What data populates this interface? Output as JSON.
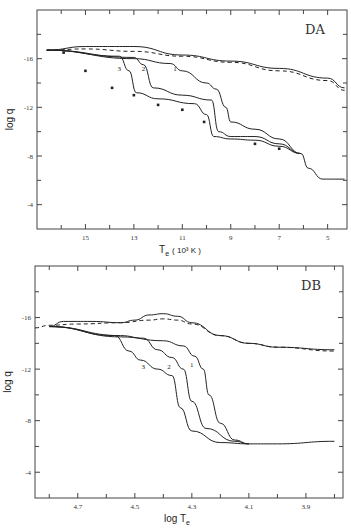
{
  "chart_data": [
    {
      "type": "line",
      "panel": "DA",
      "title": "DA",
      "xlabel": "Te (10^3 K)",
      "ylabel": "log q",
      "xlim": [
        17.0,
        4.2
      ],
      "ylim": [
        -2,
        -20
      ],
      "xticks": [
        "15",
        "13",
        "11",
        "9",
        "7",
        "5"
      ],
      "yticks": [
        "-16",
        "-12",
        "-8",
        "-4"
      ],
      "series": [
        {
          "name": "upper envelope (solid)",
          "x": [
            16.6,
            15,
            13,
            11,
            9,
            7,
            5,
            4.3
          ],
          "y": [
            -16.7,
            -17.0,
            -17.0,
            -16.3,
            -15.8,
            -15.2,
            -14.4,
            -13.6
          ]
        },
        {
          "name": "upper envelope (dashed)",
          "x": [
            16.6,
            15,
            13,
            11,
            9,
            7,
            5,
            4.3
          ],
          "y": [
            -16.7,
            -16.8,
            -16.6,
            -16.2,
            -15.7,
            -15.0,
            -14.2,
            -13.4
          ]
        },
        {
          "name": "1",
          "x": [
            16.6,
            13,
            11.5,
            11,
            10,
            9.6,
            9.2,
            9,
            8,
            7,
            6.1,
            5.8,
            5.2,
            4.3
          ],
          "y": [
            -16.7,
            -16.0,
            -15.6,
            -15.0,
            -14.0,
            -13.5,
            -12.0,
            -10.8,
            -10.2,
            -9.4,
            -8.2,
            -7.0,
            -6.1,
            -6.1
          ]
        },
        {
          "name": "2",
          "x": [
            16.6,
            13,
            12.6,
            12.2,
            11,
            9.8,
            9.5,
            9,
            8,
            7,
            6.1
          ],
          "y": [
            -16.7,
            -16.1,
            -15.5,
            -13.6,
            -13.0,
            -12.6,
            -10.0,
            -9.6,
            -9.6,
            -9.0,
            -8.2
          ]
        },
        {
          "name": "3",
          "x": [
            16.6,
            13.6,
            13.2,
            12.9,
            12,
            10.5,
            10,
            9.7,
            9,
            8,
            7,
            6.1
          ],
          "y": [
            -16.7,
            -16.2,
            -15.0,
            -13.2,
            -12.7,
            -12.3,
            -11.4,
            -9.6,
            -9.4,
            -9.3,
            -8.8,
            -8.2
          ]
        }
      ],
      "points": {
        "x": [
          15.9,
          15.0,
          13.9,
          13.0,
          12.0,
          11.0,
          10.1,
          8.0,
          7.0
        ],
        "y": [
          -16.5,
          -15.0,
          -13.6,
          -13.0,
          -12.2,
          -11.8,
          -10.8,
          -9.0,
          -8.6
        ]
      },
      "annotations": [
        "1",
        "2",
        "3",
        "DA"
      ]
    },
    {
      "type": "line",
      "panel": "DB",
      "title": "DB",
      "xlabel": "log Te",
      "ylabel": "log q",
      "xlim": [
        4.85,
        3.77
      ],
      "ylim": [
        -2,
        -20
      ],
      "xticks": [
        "4.7",
        "4.5",
        "4.3",
        "4.1",
        "3.9"
      ],
      "yticks": [
        "-16",
        "-12",
        "-8",
        "-4"
      ],
      "series": [
        {
          "name": "upper envelope (solid)",
          "x": [
            4.8,
            4.75,
            4.65,
            4.55,
            4.5,
            4.45,
            4.4,
            4.35,
            4.3,
            4.2,
            4.1,
            4.0,
            3.8
          ],
          "y": [
            -15.3,
            -15.7,
            -15.7,
            -15.6,
            -15.8,
            -16.2,
            -16.3,
            -16.1,
            -15.6,
            -14.6,
            -14.0,
            -13.7,
            -13.5
          ]
        },
        {
          "name": "upper envelope (dashed)",
          "x": [
            4.85,
            4.8,
            4.7,
            4.55,
            4.45,
            4.4,
            4.35,
            4.3,
            4.2,
            4.1,
            4.0,
            3.8
          ],
          "y": [
            -15.2,
            -15.4,
            -15.5,
            -15.6,
            -15.8,
            -15.9,
            -15.8,
            -15.5,
            -14.6,
            -14.0,
            -13.7,
            -13.4
          ]
        },
        {
          "name": "1",
          "x": [
            4.8,
            4.55,
            4.4,
            4.33,
            4.29,
            4.26,
            4.24,
            4.2,
            4.15,
            4.1,
            4.0,
            3.8
          ],
          "y": [
            -15.3,
            -14.5,
            -14.2,
            -13.8,
            -13.0,
            -12.0,
            -10.0,
            -7.8,
            -6.5,
            -6.2,
            -6.2,
            -6.4
          ]
        },
        {
          "name": "2",
          "x": [
            4.8,
            4.55,
            4.47,
            4.42,
            4.37,
            4.33,
            4.3,
            4.25,
            4.15,
            4.1
          ],
          "y": [
            -15.3,
            -14.6,
            -14.4,
            -13.5,
            -12.9,
            -12.0,
            -9.5,
            -7.4,
            -6.4,
            -6.2
          ]
        },
        {
          "name": "3",
          "x": [
            4.8,
            4.57,
            4.52,
            4.48,
            4.42,
            4.37,
            4.34,
            4.3,
            4.2,
            4.1
          ],
          "y": [
            -15.3,
            -14.6,
            -13.4,
            -12.7,
            -12.0,
            -11.5,
            -9.0,
            -7.2,
            -6.3,
            -6.2
          ]
        }
      ],
      "annotations": [
        "1",
        "2",
        "3",
        "DB"
      ]
    }
  ],
  "panels": {
    "top": {
      "tag": "DA",
      "ylabel": "log q",
      "xlabel_main": "T",
      "xlabel_sub": "e",
      "xlabel_unit": "( 10³ K )"
    },
    "bottom": {
      "tag": "DB",
      "ylabel": "log q",
      "xlabel_main": "log T",
      "xlabel_sub": "e"
    }
  }
}
